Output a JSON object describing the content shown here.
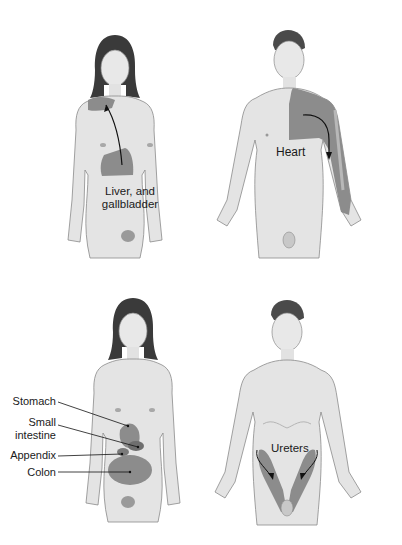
{
  "figure": {
    "panels": [
      {
        "id": "liver-gallbladder",
        "figure": "female",
        "labels": [
          "Liver, and",
          "gallbladder"
        ],
        "referred_area": "right shoulder"
      },
      {
        "id": "heart",
        "figure": "male",
        "labels": [
          "Heart"
        ],
        "referred_area": "left chest, shoulder and inner arm"
      },
      {
        "id": "digestive",
        "figure": "female",
        "labels": [
          "Stomach",
          "Small",
          "intestine",
          "Appendix",
          "Colon"
        ]
      },
      {
        "id": "ureters",
        "figure": "male",
        "labels": [
          "Ureters"
        ],
        "referred_area": "flanks to groin"
      }
    ],
    "colors": {
      "skin": "#e4e4e4",
      "skin_shadow": "#bdbdbd",
      "outline": "#8a8a8a",
      "hair": "#3a3a3a",
      "pain_area": "#8c8c8c",
      "pain_area_dark": "#707070",
      "text": "#1a1a1a"
    }
  }
}
